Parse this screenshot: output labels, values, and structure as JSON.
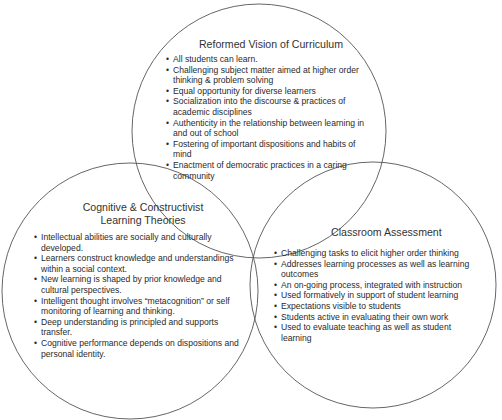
{
  "diagram": {
    "type": "venn",
    "circles": [
      {
        "id": "top",
        "title": "Reformed Vision of Curriculum",
        "items": [
          "All students can learn.",
          "Challenging subject matter aimed at higher order thinking & problem solving",
          "Equal opportunity for diverse learners",
          "Socialization into the discourse & practices of academic disciplines",
          "Authenticity in the relationship between learning in and out of school",
          "Fostering of important dispositions and habits of mind",
          "Enactment of democratic practices in a caring community"
        ]
      },
      {
        "id": "left",
        "title_line1": "Cognitive & Constructivist",
        "title_line2": "Learning Theories",
        "items": [
          "Intellectual abilities are socially and culturally developed.",
          "Learners construct knowledge and understandings within a social context.",
          "New learning is shaped by prior knowledge and cultural perspectives.",
          "Intelligent thought involves “metacognition” or self monitoring of learning and thinking.",
          "Deep understanding is principled and supports transfer.",
          "Cognitive performance depends on dispositions and personal identity."
        ]
      },
      {
        "id": "right",
        "title": "Classroom Assessment",
        "items": [
          "Challenging tasks to elicit higher order thinking",
          "Addresses learning processes as well as learning outcomes",
          "An on-going process, integrated with instruction",
          "Used formatively in support of student learning",
          "Expectations visible to students",
          "Students active in evaluating their own work",
          "Used to evaluate teaching as well as student learning"
        ]
      }
    ],
    "colors": {
      "stroke": "#555555",
      "text": "#2a2a2a",
      "background": "#ffffff"
    }
  }
}
